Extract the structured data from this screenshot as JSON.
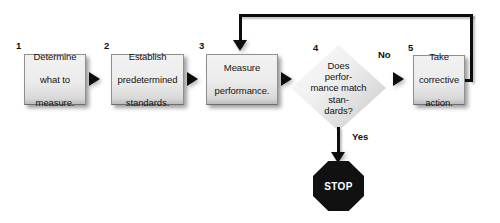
{
  "diagram": {
    "background_color": "#ffffff",
    "shape_fill": "#ebebeb",
    "line_color": "#0d0d0d",
    "stop_fill": "#111111",
    "stop_text_color": "#ffffff"
  },
  "steps": [
    {
      "number": "1",
      "type": "process",
      "lines": [
        "Determine",
        "what to",
        "measure."
      ]
    },
    {
      "number": "2",
      "type": "process",
      "lines": [
        "Establish",
        "predetermined",
        "standards."
      ]
    },
    {
      "number": "3",
      "type": "process",
      "lines": [
        "Measure",
        "performance."
      ]
    },
    {
      "number": "4",
      "type": "decision",
      "lines": [
        "Does",
        "perfor-",
        "mance match",
        "stan-",
        "dards?"
      ]
    },
    {
      "number": "5",
      "type": "process",
      "lines": [
        "Take",
        "corrective",
        "action."
      ]
    }
  ],
  "step_labels": {
    "one": "1",
    "two": "2",
    "three": "3",
    "four": "4",
    "five": "5"
  },
  "box1": {
    "l1": "Determine",
    "l2": "what to",
    "l3": "measure."
  },
  "box2": {
    "l1": "Establish",
    "l2": "predetermined",
    "l3": "standards."
  },
  "box3": {
    "l1": "Measure",
    "l2": "performance."
  },
  "diamond": {
    "l1": "Does",
    "l2": "perfor-",
    "l3": "mance match",
    "l4": "stan-",
    "l5": "dards?"
  },
  "box5": {
    "l1": "Take",
    "l2": "corrective",
    "l3": "action."
  },
  "branches": {
    "no": "No",
    "yes": "Yes"
  },
  "terminator": {
    "label": "STOP",
    "shape": "octagon"
  },
  "connectors": [
    {
      "name": "box1-to-box2",
      "kind": "arrow-right"
    },
    {
      "name": "box2-to-box3",
      "kind": "arrow-right"
    },
    {
      "name": "box3-to-diamond",
      "kind": "arrow-right"
    },
    {
      "name": "diamond-no-to-box5",
      "kind": "arrow-right"
    },
    {
      "name": "diamond-yes-to-stop",
      "kind": "arrow-down"
    },
    {
      "name": "box5-feedback-to-box3",
      "kind": "loop-up-left-down"
    }
  ]
}
